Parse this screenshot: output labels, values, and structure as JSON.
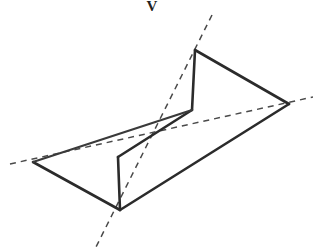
{
  "figure": {
    "background_color": "#ffffff",
    "solid_stroke_color": "#2b2b2b",
    "dashed_stroke_color": "#4a4a4a",
    "solid_stroke_width": 2.6,
    "dashed_stroke_width": 1.5,
    "dash_pattern": "6 5",
    "canvas": {
      "width": 313,
      "height": 249
    },
    "label": {
      "text": "V",
      "x": 152,
      "y": 11
    },
    "outline_points": "195,50 289,104 120,210 33,162 192,110 118,157",
    "solid_paths": [
      {
        "name": "upper-right-triangle-top-edge",
        "d": "M 195 50 L 289 104"
      },
      {
        "name": "upper-right-triangle-vertical-edge",
        "d": "M 195 50 L 192 110"
      },
      {
        "name": "band-upper-edge",
        "d": "M 192 110 L 118 157"
      },
      {
        "name": "band-lower-edge",
        "d": "M 289 104 L 120 210"
      },
      {
        "name": "lower-left-triangle-vertical-edge",
        "d": "M 118 157 L 120 210"
      },
      {
        "name": "lower-left-triangle-lower-edge",
        "d": "M 120 210 L 33 162"
      },
      {
        "name": "lower-left-triangle-upper-edge",
        "d": "M 33 162 L 192 110"
      }
    ],
    "dashed_paths": [
      {
        "name": "steep-dashed-construction-line",
        "d": "M 212 15 L 95 249",
        "orientation": "steep descending left"
      },
      {
        "name": "shallow-dashed-construction-line",
        "d": "M 10 164 L 313 97",
        "orientation": "shallow ascending right"
      }
    ],
    "vertices": [
      {
        "name": "top-apex",
        "x": 195,
        "y": 50
      },
      {
        "name": "right-tip",
        "x": 289,
        "y": 104
      },
      {
        "name": "inner-upper",
        "x": 192,
        "y": 110
      },
      {
        "name": "inner-lower",
        "x": 118,
        "y": 157
      },
      {
        "name": "left-tip",
        "x": 33,
        "y": 162
      },
      {
        "name": "bottom-apex",
        "x": 120,
        "y": 210
      }
    ]
  }
}
